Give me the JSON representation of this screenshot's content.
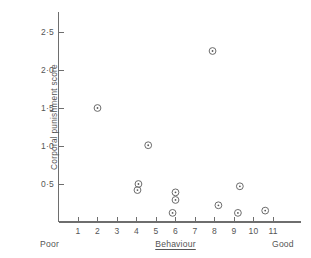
{
  "chart_data": {
    "type": "scatter",
    "title": "",
    "xlabel": "Behaviour",
    "ylabel": "Corporal punishment score",
    "xlabel_left_anchor": "Poor",
    "xlabel_right_anchor": "Good",
    "xlim": [
      0,
      12.4
    ],
    "ylim": [
      0,
      2.75
    ],
    "grid": false,
    "legend": "none",
    "marker": "circle-with-center-dot",
    "marker_color": "#6b6b6b",
    "xticks": [
      1,
      2,
      3,
      4,
      5,
      6,
      7,
      8,
      9,
      10,
      11
    ],
    "xtick_labels": [
      "1",
      "2",
      "3",
      "4",
      "5",
      "6",
      "7",
      "8",
      "9",
      "10",
      "11"
    ],
    "yticks": [
      0.5,
      1.0,
      1.5,
      2.0,
      2.5
    ],
    "ytick_labels": [
      "0·5",
      "1·0",
      "1·5",
      "2·0",
      "2·5"
    ],
    "points": [
      {
        "x": 2.0,
        "y": 1.5
      },
      {
        "x": 4.6,
        "y": 1.01
      },
      {
        "x": 4.1,
        "y": 0.5
      },
      {
        "x": 4.05,
        "y": 0.42
      },
      {
        "x": 6.0,
        "y": 0.39
      },
      {
        "x": 6.0,
        "y": 0.29
      },
      {
        "x": 5.85,
        "y": 0.12
      },
      {
        "x": 7.9,
        "y": 2.25
      },
      {
        "x": 8.2,
        "y": 0.22
      },
      {
        "x": 9.3,
        "y": 0.47
      },
      {
        "x": 9.2,
        "y": 0.12
      },
      {
        "x": 10.6,
        "y": 0.15
      }
    ]
  }
}
